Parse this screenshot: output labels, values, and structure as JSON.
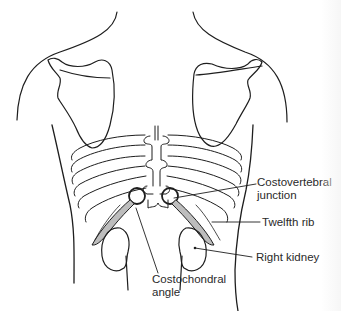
{
  "figure": {
    "line_color": "#1e1e1e",
    "shade_color": "#bdbdbd"
  },
  "labels": {
    "costovertebral": {
      "line1": "Costovertebral",
      "line2": "junction"
    },
    "twelfth_rib": {
      "text": "Twelfth rib"
    },
    "right_kidney": {
      "text": "Right kidney"
    },
    "costochondral": {
      "line1": "Costochondral",
      "line2": "angle"
    }
  }
}
